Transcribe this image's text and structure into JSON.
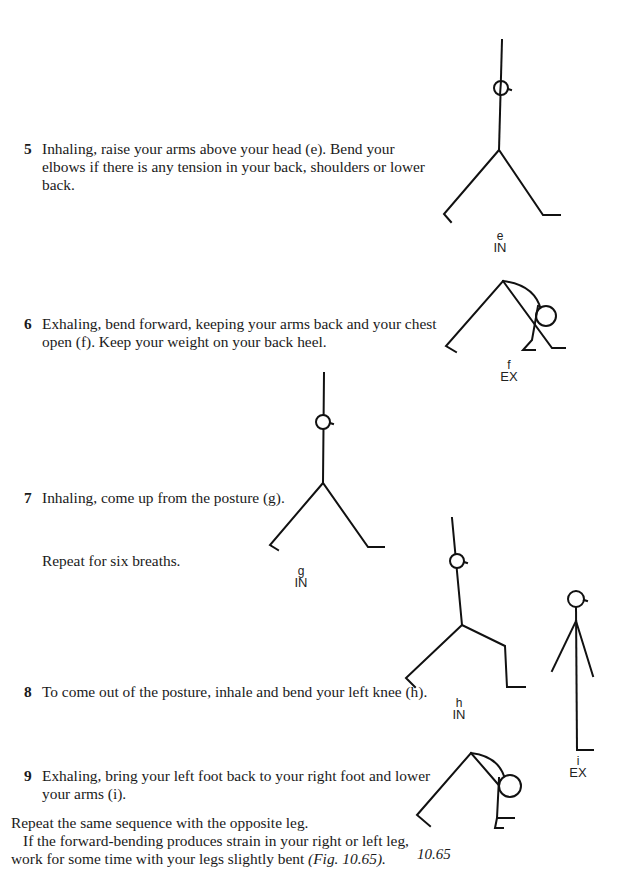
{
  "steps": [
    {
      "number": "5",
      "text": "Inhaling, raise your arms above your head (e). Bend your elbows if there is any tension in your back, shoulders or lower back."
    },
    {
      "number": "6",
      "text": "Exhaling, bend forward, keeping your arms back and your chest open (f). Keep your weight on your back heel."
    },
    {
      "number": "7",
      "text": "Inhaling, come up from the posture (g)."
    },
    {
      "number": "8",
      "text": "To come out of the posture, inhale and bend your left knee (h)."
    },
    {
      "number": "9",
      "text": "Exhaling, bring your left foot back to your right foot and lower your arms (i)."
    }
  ],
  "repeat_note": "Repeat for six breaths.",
  "closing": {
    "line1": "Repeat the same sequence with the opposite leg.",
    "line2_text": "If the forward-bending produces strain in your right or left leg, work for some time with your legs slightly bent ",
    "line2_ref": "(Fig. 10.65)."
  },
  "figures": [
    {
      "id": "e",
      "letter": "e",
      "breath": "IN"
    },
    {
      "id": "f",
      "letter": "f",
      "breath": "EX"
    },
    {
      "id": "g",
      "letter": "g",
      "breath": "IN"
    },
    {
      "id": "h",
      "letter": "h",
      "breath": "IN"
    },
    {
      "id": "i",
      "letter": "i",
      "breath": "EX"
    }
  ],
  "figure_caption": "10.65"
}
